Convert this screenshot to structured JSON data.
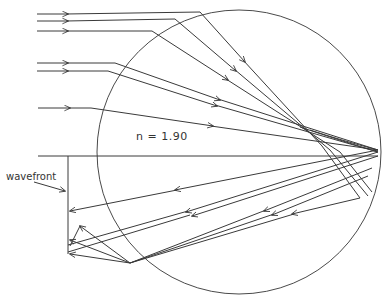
{
  "labels": {
    "refractive_index": "n  = 1.90",
    "wavefront": "wavefront"
  },
  "colors": {
    "line": "#3a3a3a",
    "background": "#ffffff"
  },
  "geometry": {
    "circle": {
      "cx": 239,
      "cy": 152,
      "r": 142
    },
    "axis_y": 156,
    "incoming_ray_y": [
      14,
      21,
      31,
      64,
      71,
      108
    ],
    "wavefront_x": 68
  }
}
